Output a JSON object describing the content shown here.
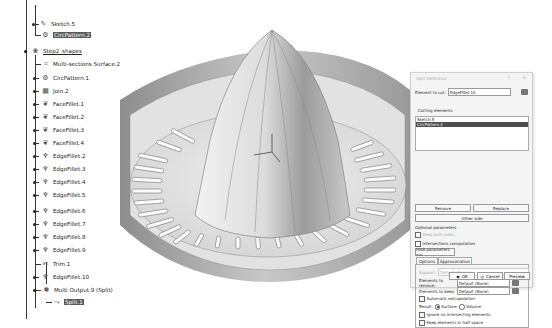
{
  "tree": {
    "items": [
      {
        "label": "Sketch.5",
        "icon": "sketch-icon",
        "selected": false
      },
      {
        "label": "CircPattern.2",
        "icon": "circpattern-icon",
        "selected": true
      },
      {
        "label": "Step2_shapes",
        "icon": "geometrical-set-icon",
        "selected": false,
        "underlined": true
      },
      {
        "label": "Multi-sections Surface.2",
        "icon": "multi-sections-surface-icon",
        "selected": false
      },
      {
        "label": "CircPattern.1",
        "icon": "circpattern-icon",
        "selected": false
      },
      {
        "label": "Join.2",
        "icon": "join-icon",
        "selected": false
      },
      {
        "label": "FaceFillet.1",
        "icon": "face-fillet-icon",
        "selected": false
      },
      {
        "label": "FaceFillet.2",
        "icon": "face-fillet-icon",
        "selected": false
      },
      {
        "label": "FaceFillet.3",
        "icon": "face-fillet-icon",
        "selected": false
      },
      {
        "label": "FaceFillet.4",
        "icon": "face-fillet-icon",
        "selected": false
      },
      {
        "label": "EdgeFillet.2",
        "icon": "edge-fillet-icon",
        "selected": false
      },
      {
        "label": "EdgeFillet.3",
        "icon": "edge-fillet-icon",
        "selected": false
      },
      {
        "label": "EdgeFillet.4",
        "icon": "edge-fillet-icon",
        "selected": false
      },
      {
        "label": "EdgeFillet.5",
        "icon": "edge-fillet-icon",
        "selected": false
      },
      {
        "label": "EdgeFillet.6",
        "icon": "edge-fillet-icon",
        "selected": false
      },
      {
        "label": "EdgeFillet.7",
        "icon": "edge-fillet-icon",
        "selected": false
      },
      {
        "label": "EdgeFillet.8",
        "icon": "edge-fillet-icon",
        "selected": false
      },
      {
        "label": "EdgeFillet.9",
        "icon": "edge-fillet-icon",
        "selected": false
      },
      {
        "label": "Trim.1",
        "icon": "trim-icon",
        "selected": false
      },
      {
        "label": "EdgeFillet.10",
        "icon": "edge-fillet-icon",
        "selected": false
      },
      {
        "label": "Multi Output.9 (Split)",
        "icon": "multi-output-icon",
        "selected": false
      },
      {
        "label": "Split.1",
        "icon": "split-icon",
        "selected": true
      }
    ]
  },
  "dialog": {
    "title": "Split Definition",
    "help_glyph": "?",
    "close_glyph": "×",
    "element_to_cut_label": "Element to cut:",
    "element_to_cut_value": "EdgeFillet.10",
    "cutting_elements_label": "Cutting elements",
    "cutting_elements": [
      {
        "label": "Sketch.5",
        "selected": false
      },
      {
        "label": "CircPattern.2",
        "selected": true
      }
    ],
    "remove_label": "Remove",
    "replace_label": "Replace",
    "other_side_label": "Other side",
    "optional_parameters_label": "Optional parameters",
    "keep_both_sides_label": "Keep both sides",
    "intersections_computation_label": "Intersections computation",
    "hide_parameters_label": "Hide parameters <<",
    "tabs": [
      {
        "label": "Options",
        "active": true
      },
      {
        "label": "Approximation",
        "active": false
      }
    ],
    "support_label": "Support:",
    "support_value": "Default (None)",
    "elements_to_remove_label": "Elements to remove:",
    "elements_to_remove_value": "Default (None)",
    "elements_to_keep_label": "Elements to keep:",
    "elements_to_keep_value": "Default (None)",
    "automatic_extrapolation_label": "Automatic extrapolation",
    "result_label": "Result:",
    "result_options": [
      {
        "label": "Surface",
        "checked": true
      },
      {
        "label": "Volume",
        "checked": false
      }
    ],
    "ignore_non_intersecting_label": "Ignore no intersecting elements",
    "keep_half_space_label": "Keep elements in half space",
    "ok_label": "OK",
    "cancel_label": "Cancel",
    "preview_label": "Preview"
  }
}
